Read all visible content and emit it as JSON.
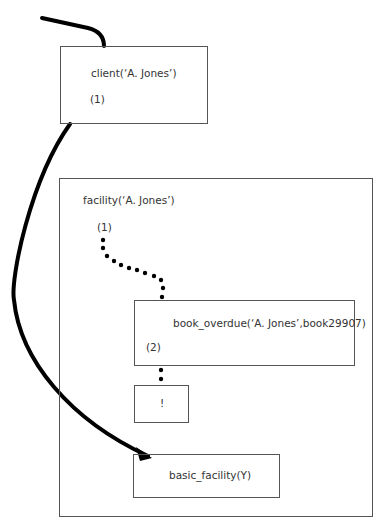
{
  "diagram": {
    "client_box": {
      "label": "client(‘A. Jones’)",
      "marker": "(1)"
    },
    "facility_box": {
      "label": "facility(‘A. Jones’)",
      "marker": "(1)"
    },
    "book_overdue_box": {
      "label": "book_overdue(‘A. Jones’,book29907)",
      "marker": "(2)"
    },
    "cut_box": {
      "label": "!"
    },
    "basic_facility_box": {
      "label": "basic_facility(Y)"
    },
    "edges": [
      {
        "from": "caller",
        "to": "client_box",
        "style": "solid-thick"
      },
      {
        "from": "client_box",
        "to": "basic_facility_box",
        "style": "solid-thick-arrow"
      },
      {
        "from": "facility_box.marker",
        "to": "book_overdue_box",
        "style": "dotted"
      },
      {
        "from": "book_overdue_box",
        "to": "cut_box",
        "style": "dotted"
      }
    ]
  }
}
